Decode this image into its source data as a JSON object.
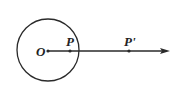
{
  "diagram": {
    "type": "geometry",
    "labels": {
      "center": "O",
      "point_inside": "P",
      "point_outside": "P'"
    },
    "elements": [
      "circle",
      "ray",
      "point-O",
      "point-P",
      "point-P-prime"
    ],
    "stroke_color": "#2a2a2a"
  }
}
